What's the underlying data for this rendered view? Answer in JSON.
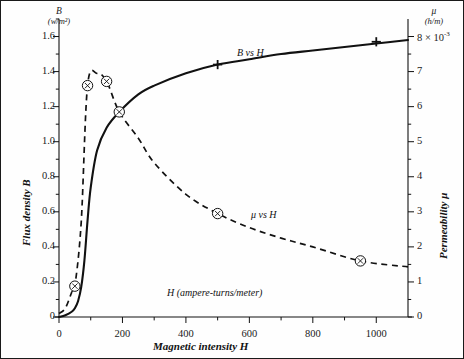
{
  "figure": {
    "background": "#ffffff",
    "line_color": "#111111",
    "border_color": "#1a1a1a"
  },
  "axes": {
    "left": {
      "title": "Flux density B",
      "symbol": "B",
      "unit": "(w/m²)",
      "ticks": [
        "0",
        "0.2",
        "0.4",
        "0.6",
        "0.8",
        "1.0",
        "1.2",
        "1.4",
        "1.6"
      ],
      "min": 0,
      "max": 1.7
    },
    "right": {
      "title": "Permeability μ",
      "symbol": "μ",
      "unit": "(h/m)",
      "ticks": [
        "0",
        "1",
        "2",
        "3",
        "4",
        "5",
        "6",
        "7"
      ],
      "top_tick_value": "8",
      "top_tick_multiplier": "× 10",
      "top_tick_exponent": "-3",
      "top_tick_label": "8 × 10⁻³",
      "min": 0,
      "max": 8.5
    },
    "bottom": {
      "title": "Magnetic intensity H",
      "unit_label": "H (ampere-turns/meter)",
      "ticks": [
        "0",
        "200",
        "400",
        "600",
        "800",
        "1000"
      ],
      "min": 0,
      "max": 1100
    }
  },
  "curves": {
    "b_vs_h": {
      "label": "B vs H",
      "style": "solid",
      "marker": "plus"
    },
    "mu_vs_h": {
      "label": "μ vs H",
      "style": "dashed",
      "marker": "circle-x"
    }
  },
  "chart_data": {
    "type": "line",
    "title": "",
    "xlabel": "Magnetic intensity H",
    "ylabel": "Flux density B",
    "y2label": "Permeability μ",
    "xlim": [
      0,
      1100
    ],
    "ylim": [
      0,
      1.7
    ],
    "y2lim": [
      0,
      8.5
    ],
    "grid": false,
    "legend": "inline-annotation",
    "xticks": [
      0,
      200,
      400,
      600,
      800,
      1000
    ],
    "yticks": [
      0,
      0.2,
      0.4,
      0.6,
      0.8,
      1.0,
      1.2,
      1.4,
      1.6
    ],
    "y2ticks": [
      0,
      1,
      2,
      3,
      4,
      5,
      6,
      7,
      8
    ],
    "y2_unit_note": "× 10⁻³ h/m",
    "series": [
      {
        "name": "B vs H",
        "axis": "left",
        "style": "solid",
        "marker": "+",
        "x": [
          0,
          20,
          40,
          50,
          60,
          70,
          80,
          90,
          100,
          120,
          150,
          190,
          250,
          300,
          400,
          500,
          600,
          700,
          800,
          900,
          1000,
          1100
        ],
        "y": [
          0,
          0.01,
          0.03,
          0.05,
          0.09,
          0.17,
          0.32,
          0.55,
          0.74,
          0.95,
          1.08,
          1.17,
          1.27,
          1.32,
          1.39,
          1.44,
          1.47,
          1.5,
          1.52,
          1.54,
          1.56,
          1.58
        ],
        "marker_points": [
          [
            500,
            1.44
          ],
          [
            1000,
            1.57
          ]
        ]
      },
      {
        "name": "μ vs H",
        "axis": "right",
        "style": "dashed",
        "marker": "⊗",
        "x": [
          0,
          20,
          40,
          50,
          70,
          90,
          120,
          150,
          190,
          250,
          300,
          400,
          500,
          600,
          700,
          800,
          950,
          1100
        ],
        "y": [
          0.1,
          0.25,
          0.7,
          0.88,
          2.7,
          6.6,
          6.95,
          6.72,
          5.85,
          5.1,
          4.4,
          3.5,
          2.95,
          2.55,
          2.25,
          2.0,
          1.6,
          1.43
        ],
        "marker_points": [
          [
            50,
            0.88
          ],
          [
            90,
            6.6
          ],
          [
            150,
            6.72
          ],
          [
            190,
            5.85
          ],
          [
            500,
            2.95
          ],
          [
            950,
            1.6
          ]
        ]
      }
    ],
    "annotations": [
      {
        "text": "B vs H",
        "x": 600,
        "y": 1.52,
        "axis": "left"
      },
      {
        "text": "μ vs H",
        "x": 640,
        "y": 2.62,
        "axis": "right"
      },
      {
        "text": "H (ampere-turns/meter)",
        "x": 520,
        "y": 0.12,
        "axis": "left"
      }
    ]
  }
}
